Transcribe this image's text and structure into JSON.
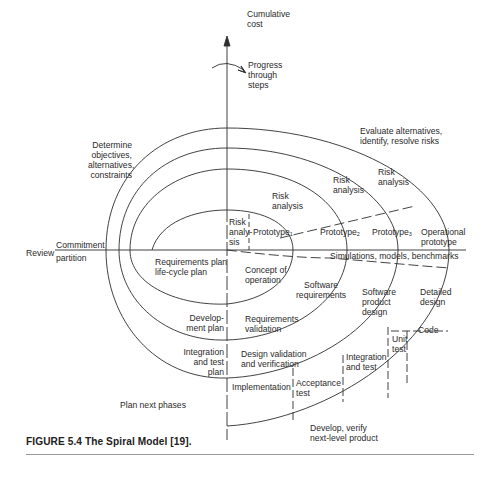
{
  "figure": {
    "caption": "FIGURE 5.4  The Spiral Model [19].",
    "axes": {
      "vertical_label_top": [
        "Cumulative",
        "cost"
      ],
      "rotation_label": [
        "Progress",
        "through",
        "steps"
      ],
      "review": "Review",
      "commitment": "Commitment",
      "partition": "partition"
    },
    "quadrants": {
      "top_left": [
        "Determine",
        "objectives,",
        "alternatives,",
        "constraints"
      ],
      "top_right": [
        "Evaluate alternatives,",
        "identify, resolve risks"
      ],
      "bottom_left": "Plan next phases",
      "bottom_right": [
        "Develop, verify",
        "next-level product"
      ]
    },
    "risk_analysis": {
      "inner": [
        "Risk",
        "analy-",
        "sis"
      ],
      "second": [
        "Risk",
        "analysis"
      ],
      "third": [
        "Risk",
        "analysis"
      ],
      "fourth": [
        "Risk",
        "analysis"
      ]
    },
    "prototypes": {
      "p1": "Prototype",
      "p1_sub": "1",
      "p2": "Prototype",
      "p2_sub": "2",
      "p3": "Prototype",
      "p3_sub": "3",
      "operational": [
        "Operational",
        "prototype"
      ]
    },
    "simulations": "Simulations, models, benchmarks",
    "planning": {
      "requirements_plan": [
        "Requirements plan",
        "life-cycle plan"
      ],
      "development_plan": [
        "Develop-",
        "ment plan"
      ],
      "integration_plan": [
        "Integration",
        "and test",
        "plan"
      ]
    },
    "development": {
      "concept": [
        "Concept of",
        "operation"
      ],
      "software_requirements": [
        "Software",
        "requirements"
      ],
      "requirements_validation": [
        "Requirements",
        "validation"
      ],
      "software_product_design": [
        "Software",
        "product",
        "design"
      ],
      "design_validation": [
        "Design validation",
        "and verification"
      ],
      "detailed_design": [
        "Detailed",
        "design"
      ],
      "code": "Code",
      "unit_test": [
        "Unit",
        "test"
      ],
      "integration_test": [
        "Integration",
        "and test"
      ],
      "acceptance_test": [
        "Acceptance",
        "test"
      ],
      "implementation": "Implementation"
    }
  }
}
